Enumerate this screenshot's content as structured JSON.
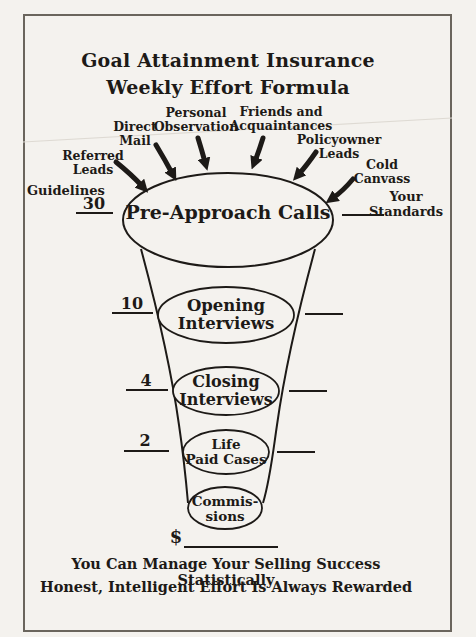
{
  "header": {
    "title_line1": "Goal Attainment Insurance",
    "title_line2": "Weekly Effort Formula"
  },
  "side_labels": {
    "guidelines": "Guidelines",
    "your_standards": "Your Standards"
  },
  "sources": [
    {
      "label": "Referred\nLeads"
    },
    {
      "label": "Direct\nMail"
    },
    {
      "label": "Personal\nObservation"
    },
    {
      "label": "Friends and\nAcquaintances"
    },
    {
      "label": "Policyowner\nLeads"
    },
    {
      "label": "Cold\nCanvass"
    }
  ],
  "stages": [
    {
      "label": "Pre-Approach Calls",
      "guideline": "30"
    },
    {
      "label": "Opening\nInterviews",
      "guideline": "10"
    },
    {
      "label": "Closing\nInterviews",
      "guideline": "4"
    },
    {
      "label": "Life\nPaid Cases",
      "guideline": "2"
    },
    {
      "label": "Commis-\nsions",
      "guideline": "$"
    }
  ],
  "footer": {
    "line1": "You Can Manage Your Selling Success Statistically",
    "line2": "Honest, Intelligent Effort Is Always Rewarded"
  },
  "colors": {
    "ink": "#1d1a17",
    "paper": "#f4f2ee",
    "border": "#6a655d"
  }
}
